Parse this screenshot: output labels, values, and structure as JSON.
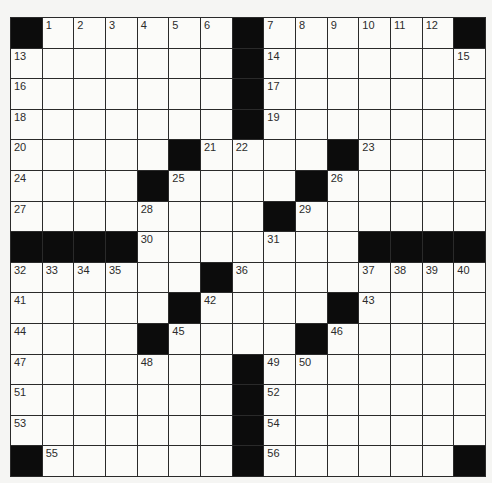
{
  "puzzle": {
    "size": {
      "rows": 15,
      "cols": 15
    },
    "colors": {
      "block": "#0c0c0c",
      "cell": "#fbfbf9",
      "line": "#2a2a2a",
      "number": "#2b2b2b"
    },
    "grid": [
      [
        "#",
        "1",
        "2",
        "3",
        "4",
        "5",
        "6",
        "#",
        "7",
        "8",
        "9",
        "10",
        "11",
        "12",
        "#"
      ],
      [
        "13",
        "",
        "",
        "",
        "",
        "",
        "",
        "#",
        "14",
        "",
        "",
        "",
        "",
        "",
        "15"
      ],
      [
        "16",
        "",
        "",
        "",
        "",
        "",
        "",
        "#",
        "17",
        "",
        "",
        "",
        "",
        "",
        ""
      ],
      [
        "18",
        "",
        "",
        "",
        "",
        "",
        "",
        "#",
        "19",
        "",
        "",
        "",
        "",
        "",
        ""
      ],
      [
        "20",
        "",
        "",
        "",
        "",
        "#",
        "21",
        "22",
        "",
        "",
        "#",
        "23",
        "",
        "",
        ""
      ],
      [
        "24",
        "",
        "",
        "",
        "#",
        "25",
        "",
        "",
        "",
        "#",
        "26",
        "",
        "",
        "",
        ""
      ],
      [
        "27",
        "",
        "",
        "",
        "28",
        "",
        "",
        "",
        "#",
        "29",
        "",
        "",
        "",
        "",
        ""
      ],
      [
        "#",
        "#",
        "#",
        "#",
        "30",
        "",
        "",
        "",
        "31",
        "",
        "",
        "#",
        "#",
        "#",
        "#"
      ],
      [
        "32",
        "33",
        "34",
        "35",
        "",
        "",
        "#",
        "36",
        "",
        "",
        "",
        "37",
        "38",
        "39",
        "40"
      ],
      [
        "41",
        "",
        "",
        "",
        "",
        "#",
        "42",
        "",
        "",
        "",
        "#",
        "43",
        "",
        "",
        ""
      ],
      [
        "44",
        "",
        "",
        "",
        "#",
        "45",
        "",
        "",
        "",
        "#",
        "46",
        "",
        "",
        "",
        ""
      ],
      [
        "47",
        "",
        "",
        "",
        "48",
        "",
        "",
        "#",
        "49",
        "50",
        "",
        "",
        "",
        "",
        ""
      ],
      [
        "51",
        "",
        "",
        "",
        "",
        "",
        "",
        "#",
        "52",
        "",
        "",
        "",
        "",
        "",
        ""
      ],
      [
        "53",
        "",
        "",
        "",
        "",
        "",
        "",
        "#",
        "54",
        "",
        "",
        "",
        "",
        "",
        ""
      ],
      [
        "#",
        "55",
        "",
        "",
        "",
        "",
        "",
        "#",
        "56",
        "",
        "",
        "",
        "",
        "",
        "#"
      ]
    ]
  }
}
